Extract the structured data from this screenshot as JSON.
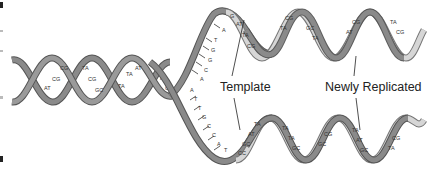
{
  "diagram": {
    "type": "dna-replication",
    "labels": {
      "template": "Template",
      "newly_replicated": "Newly Replicated"
    },
    "colors": {
      "parent_strand": "#8a8a8a",
      "parent_strand_edge": "#555555",
      "new_strand": "#d6d6d6",
      "background": "#ffffff",
      "text": "#222222"
    },
    "left_helix_pairs": [
      "CG",
      "CG",
      "AT",
      "TA",
      "CG",
      "GC",
      "TA",
      "AT"
    ],
    "upper_fork_template_bases": [
      "A",
      "T",
      "G",
      "G",
      "C",
      "A"
    ],
    "lower_fork_template_bases": [
      "A",
      "T",
      "T",
      "G",
      "C",
      "C",
      "A",
      "T"
    ],
    "upper_daughter_pairs": [
      "G",
      "AT",
      "TA",
      "CG",
      "TA",
      "CG",
      "GC",
      "TA",
      "AT",
      "TA",
      "CG"
    ],
    "lower_daughter_pairs": [
      "TA",
      "AT",
      "GC",
      "CG",
      "TA",
      "TA",
      "GC",
      "CG",
      "TA",
      "AT",
      "GC",
      "CG",
      "TA"
    ]
  }
}
